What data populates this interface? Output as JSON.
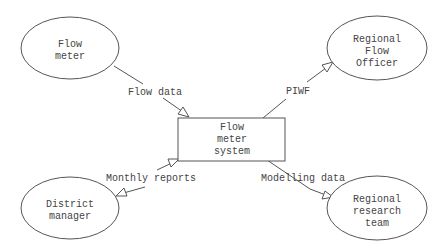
{
  "diagram": {
    "type": "context-diagram",
    "central_process": {
      "label_lines": [
        "Flow",
        "meter",
        "system"
      ]
    },
    "entities": [
      {
        "id": "flow-meter",
        "label_lines": [
          "Flow",
          "meter"
        ]
      },
      {
        "id": "regional-flow-officer",
        "label_lines": [
          "Regional",
          "Flow",
          "Officer"
        ]
      },
      {
        "id": "district-manager",
        "label_lines": [
          "District",
          "manager"
        ]
      },
      {
        "id": "regional-research-team",
        "label_lines": [
          "Regional",
          "research",
          "team"
        ]
      }
    ],
    "flows": [
      {
        "id": "flow-data",
        "label": "Flow data",
        "from": "Flow meter",
        "to": "Flow meter system"
      },
      {
        "id": "piwf",
        "label": "PIWF",
        "from": "Flow meter system",
        "to": "Regional Flow Officer"
      },
      {
        "id": "monthly-reports",
        "label": "Monthly reports",
        "between": [
          "Flow meter system",
          "District manager"
        ],
        "direction": "bidirectional"
      },
      {
        "id": "modelling-data",
        "label": "Modelling data",
        "from": "Flow meter system",
        "to": "Regional research team"
      }
    ]
  }
}
